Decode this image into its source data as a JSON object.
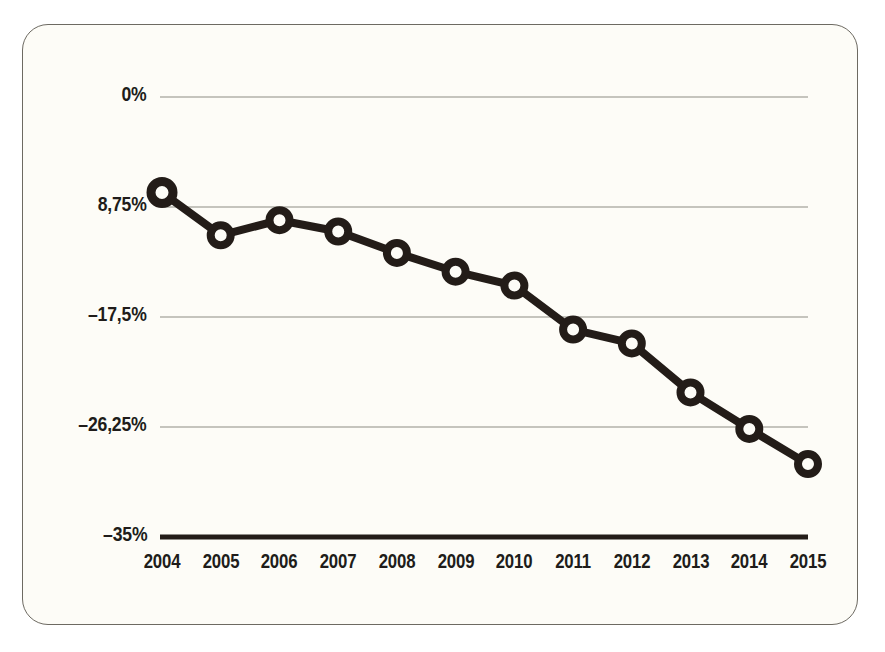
{
  "chart_data": {
    "type": "line",
    "title": "",
    "xlabel": "",
    "ylabel": "",
    "grid": true,
    "legend": null,
    "categories": [
      "2004",
      "2005",
      "2006",
      "2007",
      "2008",
      "2009",
      "2010",
      "2011",
      "2012",
      "2013",
      "2014",
      "2015"
    ],
    "values": [
      -7.6,
      -11.0,
      -9.8,
      -10.7,
      -12.4,
      -13.9,
      -15.0,
      -18.5,
      -19.6,
      -23.5,
      -26.4,
      -29.2
    ],
    "ylim": [
      -35,
      0
    ],
    "ytick_values": [
      0,
      -8.75,
      -17.5,
      -26.25,
      -35
    ],
    "ytick_labels": [
      "0%",
      "8,75%",
      "–17,5%",
      "–26,25%",
      "–35%"
    ],
    "series": [
      {
        "name": "",
        "values": [
          -7.6,
          -11.0,
          -9.8,
          -10.7,
          -12.4,
          -13.9,
          -15.0,
          -18.5,
          -19.6,
          -23.5,
          -26.4,
          -29.2
        ]
      }
    ]
  },
  "style": {
    "line_color": "#231c18",
    "marker_fill": "#FDFCF7",
    "marker_stroke": "#231c18",
    "grid_color": "#8e8b84",
    "axis_color": "#231c18",
    "background": "#FDFCF7",
    "border_color": "#6d6a62",
    "text_color": "#201c1a"
  }
}
